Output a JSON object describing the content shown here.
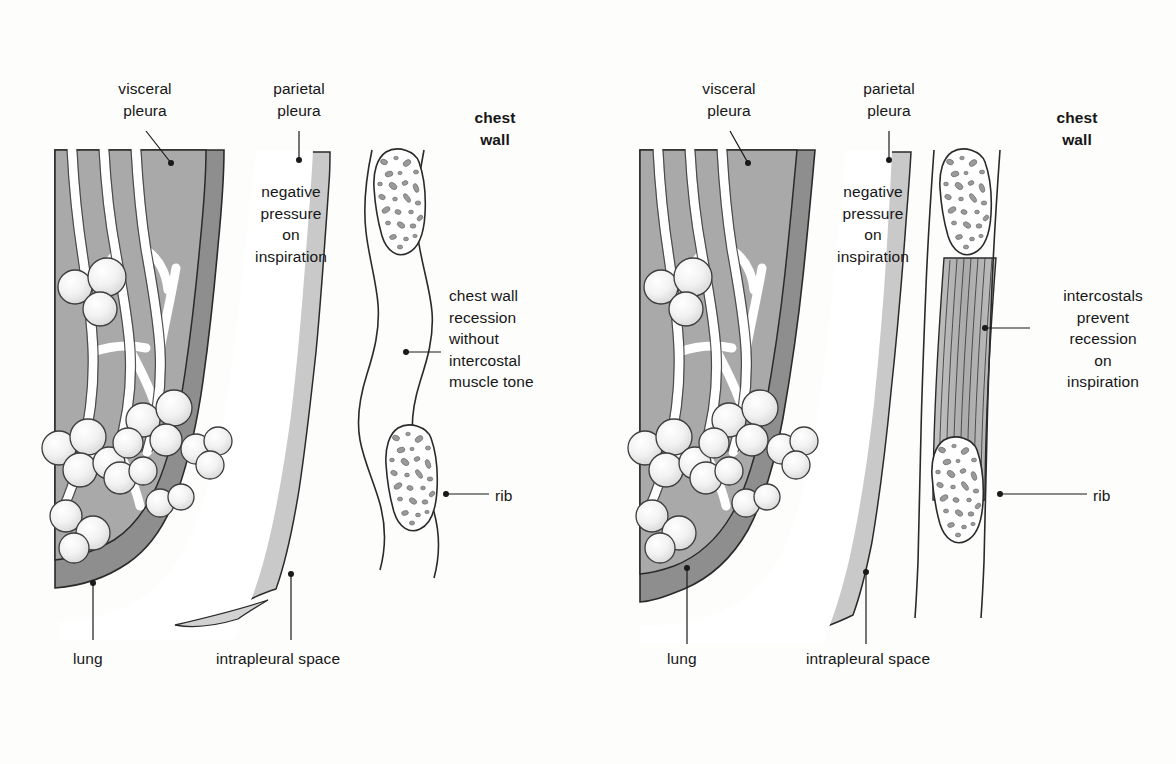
{
  "figure": {
    "background_color": "#fdfdfc",
    "ink_color": "#161616"
  },
  "colors": {
    "lung_fill": "#a9a9a9",
    "visceral_pleura_fill": "#8e8e8e",
    "parietal_pleura_fill": "#c9c9c9",
    "intrapleural_space_fill": "#ffffff",
    "rib_fill": "#ffffff",
    "rib_trabecula_fill": "#9a9a9a",
    "intercostal_muscle_fill": "#b4b4b4",
    "alveolus_fill": "#f4f4f4",
    "outline": "#2a2a2a",
    "leader_line": "#1a1a1a"
  },
  "panels": [
    {
      "id": "left-panel",
      "name": "without-intercostal-tone",
      "labels": [
        {
          "key": "visceral_pleura",
          "text": "visceral\npleura",
          "align": "center",
          "bold": false,
          "x": 95,
          "y": 78,
          "width": 100
        },
        {
          "key": "parietal_pleura",
          "text": "parietal\npleura",
          "align": "center",
          "bold": false,
          "x": 249,
          "y": 78,
          "width": 100
        },
        {
          "key": "chest_wall",
          "text": "chest\nwall",
          "align": "center",
          "bold": true,
          "x": 455,
          "y": 107,
          "width": 80
        },
        {
          "key": "negative_pressure",
          "text": "negative\npressure\non\ninspiration",
          "align": "center",
          "bold": false,
          "x": 231,
          "y": 181,
          "width": 120
        },
        {
          "key": "chest_wall_recession",
          "text": "chest wall\nrecession\nwithout\nintercostal\nmuscle tone",
          "align": "left",
          "bold": false,
          "x": 449,
          "y": 285,
          "width": 140
        },
        {
          "key": "rib",
          "text": "rib",
          "align": "left",
          "bold": false,
          "x": 495,
          "y": 485,
          "width": 50
        },
        {
          "key": "lung",
          "text": "lung",
          "align": "left",
          "bold": false,
          "x": 73,
          "y": 648,
          "width": 60
        },
        {
          "key": "intrapleural_space",
          "text": "intrapleural space",
          "align": "left",
          "bold": false,
          "x": 216,
          "y": 648,
          "width": 180
        }
      ]
    },
    {
      "id": "right-panel",
      "name": "with-intercostal-tone",
      "labels": [
        {
          "key": "visceral_pleura",
          "text": "visceral\npleura",
          "align": "center",
          "bold": false,
          "x": 679,
          "y": 78,
          "width": 100
        },
        {
          "key": "parietal_pleura",
          "text": "parietal\npleura",
          "align": "center",
          "bold": false,
          "x": 839,
          "y": 78,
          "width": 100
        },
        {
          "key": "chest_wall",
          "text": "chest\nwall",
          "align": "center",
          "bold": true,
          "x": 1037,
          "y": 107,
          "width": 80
        },
        {
          "key": "negative_pressure",
          "text": "negative\npressure\non\ninspiration",
          "align": "center",
          "bold": false,
          "x": 813,
          "y": 181,
          "width": 120
        },
        {
          "key": "intercostals_prevent",
          "text": "intercostals\nprevent\nrecession\non\ninspiration",
          "align": "center",
          "bold": false,
          "x": 1038,
          "y": 285,
          "width": 130
        },
        {
          "key": "rib",
          "text": "rib",
          "align": "left",
          "bold": false,
          "x": 1093,
          "y": 485,
          "width": 50
        },
        {
          "key": "lung",
          "text": "lung",
          "align": "left",
          "bold": false,
          "x": 667,
          "y": 648,
          "width": 60
        },
        {
          "key": "intrapleural_space",
          "text": "intrapleural space",
          "align": "left",
          "bold": false,
          "x": 806,
          "y": 648,
          "width": 180
        }
      ]
    }
  ],
  "structures": {
    "lung": "shaded parenchyma containing branching bronchial tree with clustered alveoli",
    "visceral_pleura": "dark grey membrane hugging the lung surface",
    "intrapleural_space": "thin white gap between visceral and parietal pleura",
    "parietal_pleura": "light grey membrane lining the chest wall",
    "rib": "white cortical outline filled with grey trabecular speckles, shown in cross-section",
    "intercostal_muscle": "grey striated fibre bundle spanning between ribs (right panel only)",
    "intercostal_space_left": "wavy indrawn soft tissue between ribs with no muscle (left panel)"
  }
}
